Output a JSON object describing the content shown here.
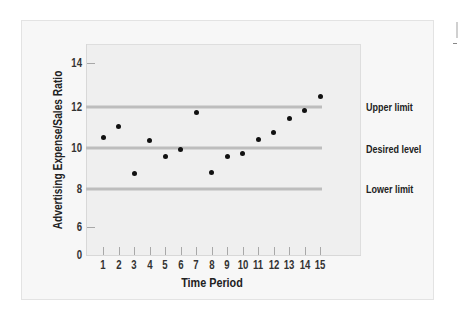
{
  "chart_data": {
    "type": "scatter",
    "title": "",
    "xlabel": "Time Period",
    "ylabel": "Advertising Expense/Sales Ratio",
    "x": [
      1,
      2,
      3,
      4,
      5,
      6,
      7,
      8,
      9,
      10,
      11,
      12,
      13,
      14,
      15
    ],
    "series": [
      {
        "name": "Advertising Expense/Sales Ratio",
        "values": [
          10.5,
          11.05,
          8.75,
          10.35,
          9.6,
          9.95,
          11.7,
          8.8,
          9.6,
          9.75,
          10.4,
          10.75,
          11.45,
          11.8,
          12.5
        ]
      }
    ],
    "reference_lines": [
      {
        "label": "Upper limit",
        "value": 12
      },
      {
        "label": "Desired level",
        "value": 10
      },
      {
        "label": "Lower limit",
        "value": 8
      }
    ],
    "y_ticks": [
      0,
      6,
      8,
      10,
      12,
      14
    ],
    "x_ticks": [
      1,
      2,
      3,
      4,
      5,
      6,
      7,
      8,
      9,
      10,
      11,
      12,
      13,
      14,
      15
    ],
    "ylim": [
      0,
      14
    ],
    "axis_break": "y-axis jumps from 0 to 6",
    "grid": false,
    "legend": "none (reference lines labeled at right)"
  },
  "axes": {
    "y_title": "Advertising Expense/Sales Ratio",
    "x_title": "Time Period",
    "y_ticks": [
      {
        "label": "14",
        "y": 63
      },
      {
        "label": "12",
        "y": 106.7
      },
      {
        "label": "10",
        "y": 148
      },
      {
        "label": "8",
        "y": 188.7
      },
      {
        "label": "6",
        "y": 227
      },
      {
        "label": "0",
        "y": 255
      }
    ],
    "x_ticks": [
      "1",
      "2",
      "3",
      "4",
      "5",
      "6",
      "7",
      "8",
      "9",
      "10",
      "11",
      "12",
      "13",
      "14",
      "15"
    ]
  },
  "labels": {
    "upper": "Upper limit",
    "desired": "Desired level",
    "lower": "Lower limit"
  },
  "colors": {
    "point": "#111111",
    "reference_line": "#bdbdbd",
    "plot_bg": "#efefef",
    "card_bg": "#f7f7f7"
  }
}
